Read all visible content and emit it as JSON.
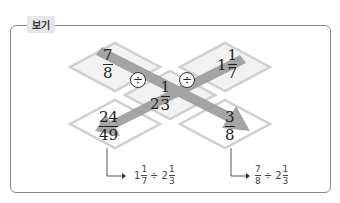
{
  "label": "보기",
  "center": {
    "whole": "2",
    "num": "1",
    "den": "3"
  },
  "top_left": {
    "num": "7",
    "den": "8"
  },
  "top_right": {
    "whole": "1",
    "num": "1",
    "den": "7"
  },
  "bottom_left": {
    "num": "24",
    "den": "49"
  },
  "bottom_right": {
    "num": "3",
    "den": "8"
  },
  "operator": "÷",
  "expr_left": {
    "a_whole": "1",
    "a_num": "1",
    "a_den": "7",
    "op": "÷",
    "b_whole": "2",
    "b_num": "1",
    "b_den": "3"
  },
  "expr_right": {
    "a_num": "7",
    "a_den": "8",
    "op": "÷",
    "b_whole": "2",
    "b_num": "1",
    "b_den": "3"
  },
  "colors": {
    "diamond_fill": "#f2f2f2",
    "diamond_border": "#c8c8c8",
    "arrow": "#9a9a9a",
    "frame": "#8a8a8a"
  }
}
